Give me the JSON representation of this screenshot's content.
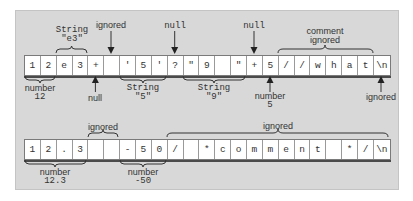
{
  "rows": [
    {
      "cells": [
        "1",
        "2",
        "e",
        "3",
        "+",
        " ",
        "'",
        "5",
        "'",
        "?",
        "\"",
        "9",
        " ",
        "\"",
        "+",
        "5",
        "/",
        "/",
        "w",
        "h",
        "a",
        "t",
        "\\n"
      ]
    },
    {
      "cells": [
        "1",
        "2",
        ".",
        "3",
        " ",
        " ",
        "-",
        "5",
        "0",
        "/",
        " ",
        "*",
        "c",
        "o",
        "m",
        "m",
        "e",
        "n",
        "t",
        " ",
        "*",
        "/",
        "\\n"
      ]
    }
  ],
  "annotations": {
    "top_row": {
      "string_e3": {
        "kind": "String",
        "value": "\"e3\""
      },
      "ignored_space": "ignored",
      "null_question": "null",
      "null_plus": "null",
      "comment": {
        "line1": "comment",
        "line2": "ignored"
      },
      "number_12": {
        "kind": "number",
        "value": "12"
      },
      "null_plus_first": "null",
      "string_5": {
        "kind": "String",
        "value": "\"5\""
      },
      "string_9": {
        "kind": "String",
        "value": "\"9\""
      },
      "number_5": {
        "kind": "number",
        "value": "5"
      },
      "ignored_newline": "ignored"
    },
    "bottom_row": {
      "ignored_spaces": "ignored",
      "ignored_comment": "ignored",
      "number_12_3": {
        "kind": "number",
        "value": "12.3"
      },
      "number_neg50": {
        "kind": "number",
        "value": "-50"
      }
    }
  },
  "colors": {
    "panel": "#d8d8d8",
    "cell": "#ffffff",
    "ink": "#333333"
  }
}
